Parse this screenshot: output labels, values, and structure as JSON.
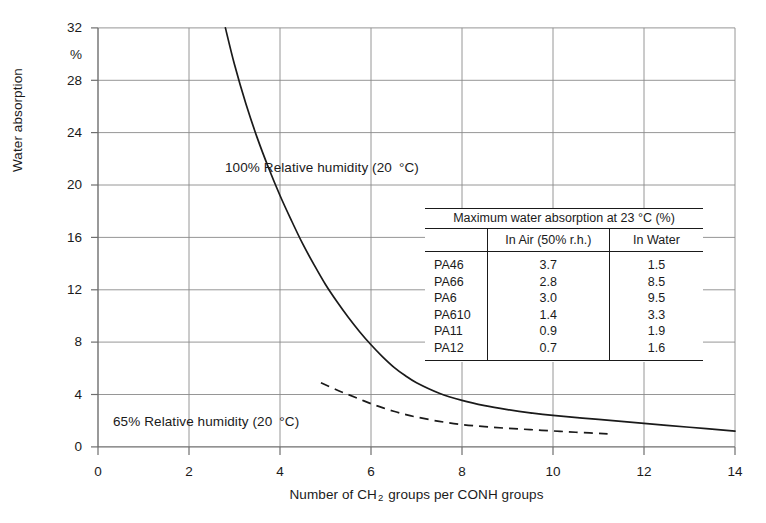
{
  "chart": {
    "type": "line",
    "ylabel": "Water absorption",
    "y_unit_label": "%",
    "xlabel_prefix": "Number of CH",
    "xlabel_sub": "2",
    "xlabel_suffix": " groups per CONH groups",
    "xlabel_full": "Number of CH2 groups per CONH groups",
    "yticks": [
      "32",
      "28",
      "24",
      "20",
      "16",
      "12",
      "8",
      "4",
      "0"
    ],
    "xticks": [
      "0",
      "2",
      "4",
      "6",
      "8",
      "10",
      "12",
      "14"
    ],
    "ylim": [
      0,
      32
    ],
    "xlim": [
      0,
      14
    ],
    "grid": true,
    "annotations": [
      {
        "id": "a100",
        "text_main": "100% Relative humidity (20",
        "text_deg": "°C)"
      },
      {
        "id": "a65",
        "text_main": "65% Relative humidity (20",
        "text_deg": "°C)"
      }
    ],
    "series": [
      {
        "name": "100% Relative humidity (20 °C)",
        "style": "solid",
        "x": [
          2.8,
          3.0,
          3.25,
          3.5,
          3.75,
          4.0,
          4.25,
          4.5,
          4.75,
          5.0,
          5.25,
          5.5,
          5.75,
          6.0,
          6.25,
          6.5,
          6.75,
          7.0,
          7.5,
          8.0,
          8.5,
          9.0,
          9.5,
          10.0,
          11.0,
          12.0,
          13.0,
          14.0
        ],
        "y": [
          32.0,
          29.2,
          26.2,
          23.6,
          21.3,
          19.2,
          17.3,
          15.5,
          13.9,
          12.4,
          11.1,
          9.9,
          8.8,
          7.8,
          6.9,
          6.1,
          5.45,
          4.9,
          4.1,
          3.55,
          3.15,
          2.85,
          2.6,
          2.4,
          2.1,
          1.8,
          1.5,
          1.2
        ]
      },
      {
        "name": "65% Relative humidity (20 °C)",
        "style": "dashed",
        "x": [
          4.9,
          5.25,
          5.5,
          5.75,
          6.0,
          6.25,
          6.5,
          6.75,
          7.0,
          7.5,
          8.0,
          8.5,
          9.0,
          9.5,
          10.0,
          10.5,
          11.2
        ],
        "y": [
          4.9,
          4.35,
          4.0,
          3.65,
          3.3,
          3.0,
          2.72,
          2.48,
          2.28,
          1.95,
          1.7,
          1.55,
          1.42,
          1.32,
          1.22,
          1.12,
          1.0
        ]
      }
    ]
  },
  "inset_table": {
    "title": "Maximum water absorption at 23 °C (%)",
    "columns": [
      "",
      "In Air (50% r.h.)",
      "In Water"
    ],
    "rows": [
      {
        "name": "PA46",
        "in_air": "3.7",
        "in_water": "1.5"
      },
      {
        "name": "PA66",
        "in_air": "2.8",
        "in_water": "8.5"
      },
      {
        "name": "PA6",
        "in_air": "3.0",
        "in_water": "9.5"
      },
      {
        "name": "PA610",
        "in_air": "1.4",
        "in_water": "3.3"
      },
      {
        "name": "PA11",
        "in_air": "0.9",
        "in_water": "1.9"
      },
      {
        "name": "PA12",
        "in_air": "0.7",
        "in_water": "1.6"
      }
    ]
  },
  "colors": {
    "ink": "#1a1a1a",
    "grid": "#8a8a8a",
    "axis": "#6e6e6e",
    "background": "#ffffff"
  }
}
